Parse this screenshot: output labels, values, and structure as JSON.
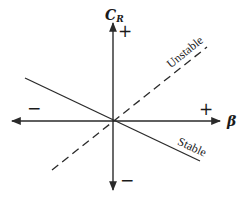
{
  "diagram": {
    "vertical_axis": {
      "label_main": "C",
      "label_sub": "R",
      "positive_sign": "+",
      "negative_sign": "−"
    },
    "horizontal_axis": {
      "label": "β",
      "positive_sign": "+",
      "negative_sign": "−"
    },
    "lines": [
      {
        "name": "Unstable",
        "style": "dashed",
        "slope": "positive"
      },
      {
        "name": "Stable",
        "style": "solid",
        "slope": "negative"
      }
    ],
    "colors": {
      "line": "#2a2a2a",
      "background": "#ffffff"
    }
  }
}
